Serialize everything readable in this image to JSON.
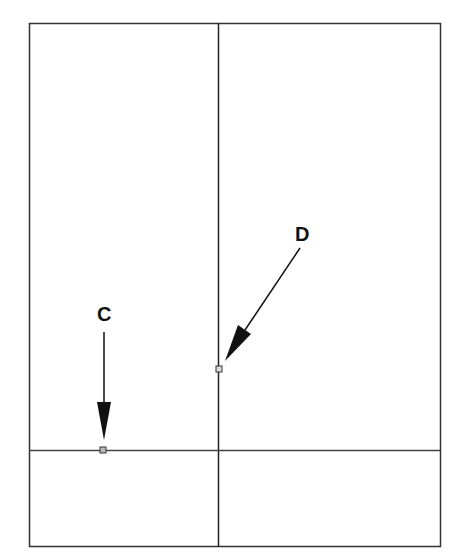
{
  "diagram": {
    "type": "wall-panel-layout",
    "stroke_color": "#333333",
    "labels": {
      "C": "C",
      "D": "D"
    },
    "frame": {
      "x": 29,
      "y": 23,
      "width": 411,
      "height": 524
    },
    "vertical_divider_x": 218,
    "horizontal_divider_y": 450,
    "points": [
      {
        "id": "C",
        "x": 103,
        "y": 450
      },
      {
        "id": "D",
        "x": 219,
        "y": 369
      }
    ]
  }
}
